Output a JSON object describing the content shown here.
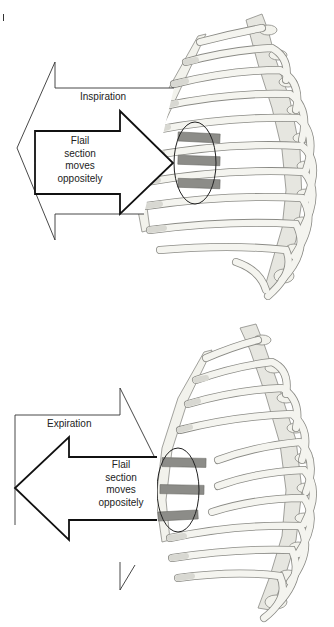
{
  "diagram": {
    "topic": "Flail chest paradoxical movement",
    "colors": {
      "bone_fill": "#f4f4ef",
      "bone_stroke": "#8a8a85",
      "cartilage": "#d8d8d2",
      "flail_segment": "#8c8c88",
      "arrow_stroke": "#1a1a1a",
      "background": "#ffffff"
    },
    "panels": [
      {
        "id": "inspiration",
        "phase_label": "Inspiration",
        "phase_arrow_direction": "left",
        "flail_label_lines": [
          "Flail",
          "section",
          "moves",
          "oppositely"
        ],
        "flail_arrow_direction": "right"
      },
      {
        "id": "expiration",
        "phase_label": "Expiration",
        "phase_arrow_direction": "right",
        "flail_label_lines": [
          "Flail",
          "section",
          "moves",
          "oppositely"
        ],
        "flail_arrow_direction": "left"
      }
    ]
  }
}
